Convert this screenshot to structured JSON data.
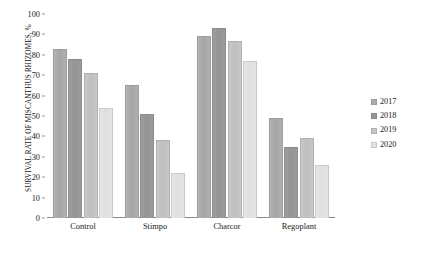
{
  "chart_data": {
    "type": "bar",
    "title": "",
    "xlabel": "",
    "ylabel": "SURVIVAL RATE OF MISCANTHUS RHIZOMES, %",
    "ylim": [
      0,
      100
    ],
    "yticks": [
      0,
      10,
      20,
      30,
      40,
      50,
      60,
      70,
      80,
      90,
      100
    ],
    "grid": false,
    "legend_position": "right",
    "categories": [
      "Control",
      "Stimpo",
      "Charcor",
      "Regoplant"
    ],
    "series": [
      {
        "name": "2017",
        "color": "#ababab",
        "values": [
          83,
          65,
          89,
          49
        ]
      },
      {
        "name": "2018",
        "color": "#979797",
        "values": [
          78,
          51,
          93,
          35
        ]
      },
      {
        "name": "2019",
        "color": "#c4c4c4",
        "values": [
          71,
          38,
          87,
          39
        ]
      },
      {
        "name": "2020",
        "color": "#e3e3e3",
        "values": [
          54,
          22,
          77,
          26
        ]
      }
    ]
  }
}
